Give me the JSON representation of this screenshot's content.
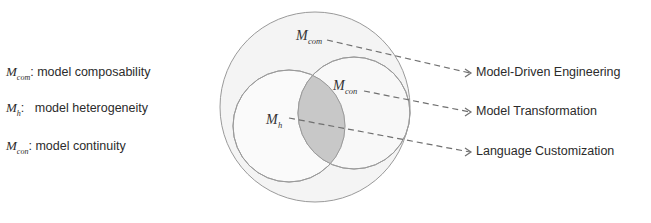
{
  "legend": [
    {
      "symbol": "M",
      "subscript": "com",
      "separator": ":",
      "text": "model composability"
    },
    {
      "symbol": "M",
      "subscript": "h",
      "separator": ":",
      "text": "model heterogeneity"
    },
    {
      "symbol": "M",
      "subscript": "con",
      "separator": ":",
      "text": "model continuity"
    }
  ],
  "diagram": {
    "outer_label": {
      "symbol": "M",
      "subscript": "com"
    },
    "right_label": {
      "symbol": "M",
      "subscript": "con"
    },
    "left_label": {
      "symbol": "M",
      "subscript": "h"
    },
    "colors": {
      "outer_fill": "#f3f3f3",
      "stroke": "#9a9a9a",
      "intersection_fill": "#c8c8c8",
      "arrow": "#707070"
    }
  },
  "targets": [
    {
      "text": "Model-Driven Engineering"
    },
    {
      "text": "Model Transformation"
    },
    {
      "text": "Language Customization"
    }
  ]
}
